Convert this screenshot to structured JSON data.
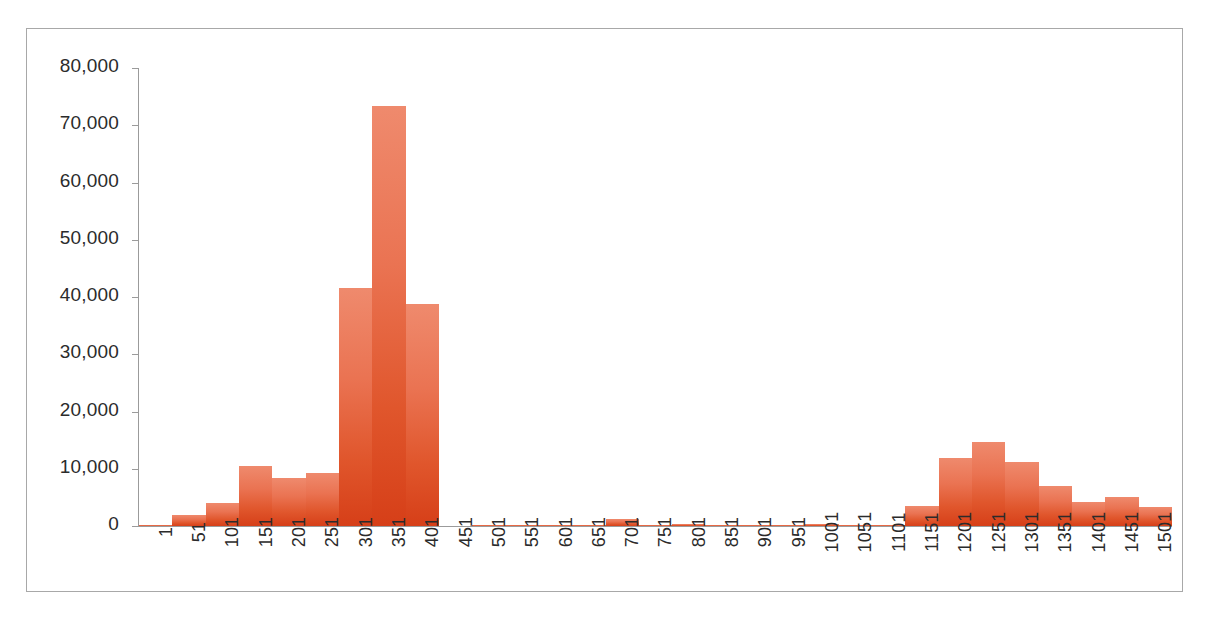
{
  "chart_data": {
    "type": "bar",
    "title": "",
    "subtitle": "",
    "xlabel": "",
    "ylabel": "",
    "ylim": [
      0,
      80000
    ],
    "ytick_step": 10000,
    "ytick_labels": [
      "80,000",
      "70,000",
      "60,000",
      "50,000",
      "40,000",
      "30,000",
      "20,000",
      "10,000",
      "0"
    ],
    "ytick_values": [
      80000,
      70000,
      60000,
      50000,
      40000,
      30000,
      20000,
      10000,
      0
    ],
    "grid": false,
    "legend": null,
    "legend_position": "none",
    "bar_style": "histogram-contiguous",
    "bar_gradient_top": "#ef8a6d",
    "bar_gradient_bottom": "#d63f18",
    "axis_color": "#9b9b9b",
    "frame_border_color": "#a8a8a8",
    "background_color": "#ffffff",
    "text_color": "#2b2b2b",
    "xtick_rotation_degrees": 90,
    "categories": [
      "1",
      "51",
      "101",
      "151",
      "201",
      "251",
      "301",
      "351",
      "401",
      "451",
      "501",
      "551",
      "601",
      "651",
      "701",
      "751",
      "801",
      "851",
      "901",
      "951",
      "1001",
      "1051",
      "1101",
      "1151",
      "1201",
      "1251",
      "1301",
      "1351",
      "1401",
      "1451",
      "1501"
    ],
    "values": [
      150,
      1900,
      4000,
      10400,
      8300,
      9200,
      41500,
      73300,
      38800,
      0,
      100,
      60,
      60,
      60,
      1250,
      60,
      400,
      80,
      60,
      60,
      300,
      250,
      250,
      3500,
      11900,
      14600,
      11200,
      7000,
      4200,
      5000,
      3400
    ]
  }
}
